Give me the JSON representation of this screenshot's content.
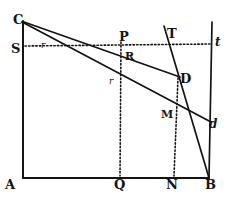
{
  "figure": {
    "ink_color": "#141414",
    "background_color": "#ffffff",
    "width": 232,
    "height": 200
  },
  "labels": [
    {
      "id": "C",
      "text": "C",
      "x": 13,
      "y": 13,
      "style": "lbl-major"
    },
    {
      "id": "S",
      "text": "S",
      "x": 11,
      "y": 42,
      "style": "lbl-major"
    },
    {
      "id": "A",
      "text": "A",
      "x": 5,
      "y": 178,
      "style": "lbl-major"
    },
    {
      "id": "Q",
      "text": "Q",
      "x": 114,
      "y": 178,
      "style": "lbl-major"
    },
    {
      "id": "N",
      "text": "N",
      "x": 166,
      "y": 178,
      "style": "lbl-major"
    },
    {
      "id": "B",
      "text": "B",
      "x": 205,
      "y": 178,
      "style": "lbl-major"
    },
    {
      "id": "P",
      "text": "P",
      "x": 119,
      "y": 30,
      "style": "lbl-major"
    },
    {
      "id": "T",
      "text": "T",
      "x": 167,
      "y": 27,
      "style": "lbl-major"
    },
    {
      "id": "D",
      "text": "D",
      "x": 180,
      "y": 72,
      "style": "lbl-major"
    },
    {
      "id": "M",
      "text": "M",
      "x": 161,
      "y": 109,
      "style": "lbl-minor"
    },
    {
      "id": "R",
      "text": "R",
      "x": 125,
      "y": 51,
      "style": "lbl-minor"
    },
    {
      "id": "t",
      "text": "t",
      "x": 215,
      "y": 36,
      "style": "lbl-italic"
    },
    {
      "id": "d",
      "text": "d",
      "x": 209,
      "y": 118,
      "style": "lbl-italic"
    },
    {
      "id": "r1",
      "text": "r",
      "x": 109,
      "y": 77,
      "style": "lbl-small"
    },
    {
      "id": "r2",
      "text": "r",
      "x": 41,
      "y": 41,
      "style": "lbl-small"
    }
  ],
  "solid_lines": [
    {
      "id": "left-side-AC",
      "x1": 23,
      "y1": 21,
      "x2": 23,
      "y2": 178,
      "width": 2.0
    },
    {
      "id": "base-AB",
      "x1": 23,
      "y1": 178,
      "x2": 209,
      "y2": 178,
      "width": 2.0
    },
    {
      "id": "ray-C-to-D",
      "x1": 24,
      "y1": 22,
      "x2": 180,
      "y2": 77,
      "width": 1.8
    },
    {
      "id": "ray-C-to-d",
      "x1": 24,
      "y1": 23,
      "x2": 211,
      "y2": 122,
      "width": 1.8
    },
    {
      "id": "line-T-to-B",
      "x1": 164,
      "y1": 26,
      "x2": 209,
      "y2": 178,
      "width": 1.7
    },
    {
      "id": "right-side-t-B",
      "x1": 212,
      "y1": 22,
      "x2": 209,
      "y2": 178,
      "width": 1.7
    }
  ],
  "dotted_lines": [
    {
      "id": "horizontal-S-to-t",
      "x1": 25,
      "y1": 46,
      "x2": 212,
      "y2": 44,
      "width": 1.6
    },
    {
      "id": "vertical-P-to-Q",
      "x1": 121,
      "y1": 42,
      "x2": 120,
      "y2": 176,
      "width": 1.6
    },
    {
      "id": "vertical-D-to-N",
      "x1": 178,
      "y1": 78,
      "x2": 174,
      "y2": 176,
      "width": 1.6
    }
  ]
}
